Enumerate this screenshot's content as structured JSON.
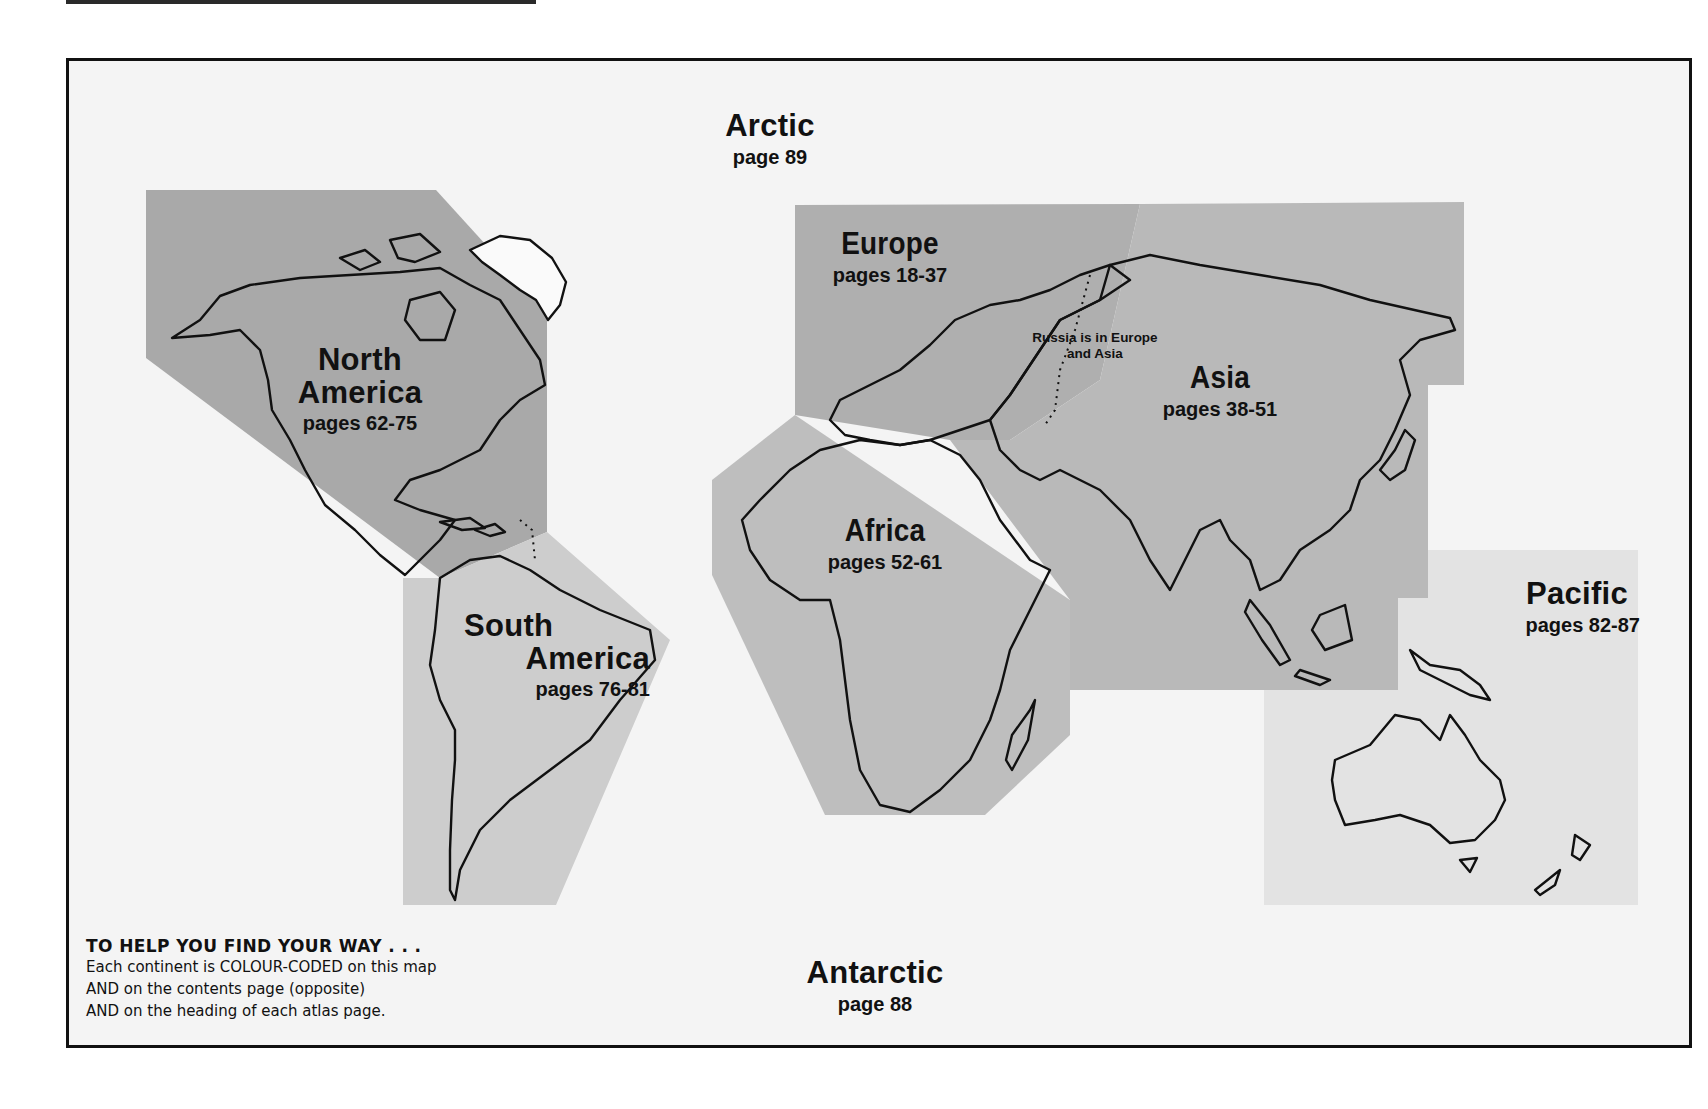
{
  "colors": {
    "page_bg": "#ffffff",
    "frame_bg": "#f4f4f4",
    "frame_border": "#111111",
    "north_america": "#a9a9a9",
    "south_america": "#cdcdcd",
    "europe": "#afafaf",
    "asia": "#b9b9b9",
    "africa": "#bebebe",
    "pacific": "#e3e3e3",
    "outline": "#111111"
  },
  "regions": {
    "arctic": {
      "name": "Arctic",
      "pages": "page 89"
    },
    "north_america": {
      "name_line1": "North",
      "name_line2": "America",
      "pages": "pages 62-75"
    },
    "south_america": {
      "name_line1": "South",
      "name_line2": "America",
      "pages": "pages 76-81"
    },
    "europe": {
      "name": "Europe",
      "pages": "pages 18-37"
    },
    "asia": {
      "name": "Asia",
      "pages": "pages 38-51"
    },
    "africa": {
      "name": "Africa",
      "pages": "pages 52-61"
    },
    "pacific": {
      "name": "Pacific",
      "pages": "pages 82-87"
    },
    "antarctic": {
      "name": "Antarctic",
      "pages": "page 88"
    }
  },
  "russia_note": {
    "line1": "Russia is in Europe",
    "line2": "and Asia"
  },
  "legend": {
    "heading": "TO HELP YOU FIND YOUR WAY . . .",
    "lines": [
      "Each continent is COLOUR-CODED on this map",
      "AND on the contents page (opposite)",
      "AND on the heading of each atlas page."
    ]
  }
}
